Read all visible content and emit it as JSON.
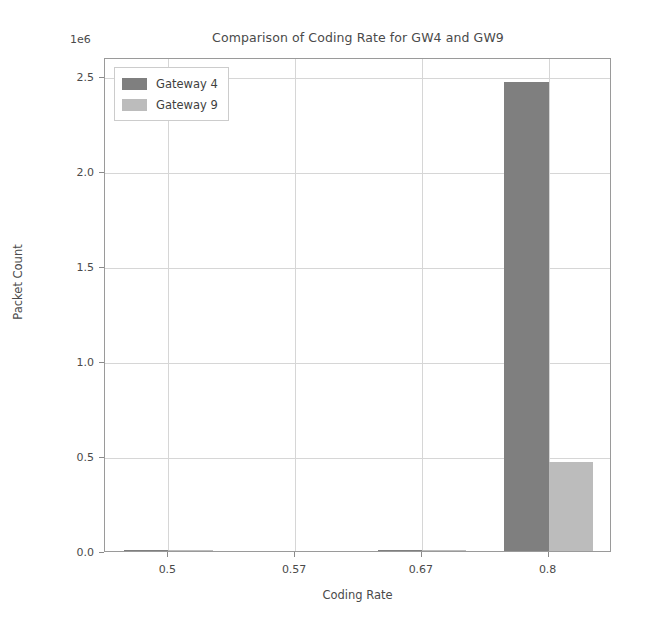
{
  "chart_data": {
    "type": "bar",
    "title": "Comparison of Coding Rate for GW4 and GW9",
    "xlabel": "Coding Rate",
    "ylabel": "Packet Count",
    "y_offset_text": "1e6",
    "categories": [
      "0.5",
      "0.57",
      "0.67",
      "0.8"
    ],
    "series": [
      {
        "name": "Gateway 4",
        "color": "#7f7f7f",
        "values": [
          4000,
          0,
          6000,
          2470000
        ]
      },
      {
        "name": "Gateway 9",
        "color": "#bcbcbc",
        "values": [
          2000,
          0,
          3000,
          470000
        ]
      }
    ],
    "ytick_labels": [
      "0.0",
      "0.5",
      "1.0",
      "1.5",
      "2.0",
      "2.5"
    ],
    "ytick_values": [
      0,
      500000,
      1000000,
      1500000,
      2000000,
      2500000
    ],
    "xtick_labels": [
      "0.5",
      "0.57",
      "0.67",
      "0.8"
    ],
    "ylim": [
      0,
      2600000
    ],
    "grid": true,
    "legend_position": "upper left"
  },
  "legend": {
    "entries": [
      {
        "label": "Gateway 4"
      },
      {
        "label": "Gateway 9"
      }
    ]
  }
}
